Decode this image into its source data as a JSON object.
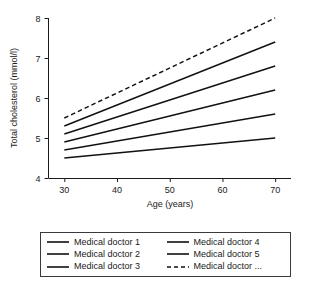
{
  "chart_data": {
    "type": "line",
    "title": "",
    "xlabel": "Age (years)",
    "ylabel": "Total cholesterol (mmol/l)",
    "xlim": [
      27,
      73
    ],
    "ylim": [
      4,
      8
    ],
    "xticks": [
      30,
      40,
      50,
      60,
      70
    ],
    "yticks": [
      4,
      5,
      6,
      7,
      8
    ],
    "xtick_labels": [
      "30",
      "40",
      "50",
      "60",
      "70"
    ],
    "ytick_labels": [
      "4",
      "5",
      "6",
      "7",
      "8"
    ],
    "grid": false,
    "legend_position": "below",
    "legend_columns": 2,
    "x": [
      30,
      70
    ],
    "series": [
      {
        "name": "Medical doctor 1",
        "values": [
          4.5,
          5.0
        ],
        "style": "solid"
      },
      {
        "name": "Medical doctor 2",
        "values": [
          4.7,
          5.6
        ],
        "style": "solid"
      },
      {
        "name": "Medical doctor 3",
        "values": [
          4.9,
          6.2
        ],
        "style": "solid"
      },
      {
        "name": "Medical doctor 4",
        "values": [
          5.1,
          6.8
        ],
        "style": "solid"
      },
      {
        "name": "Medical doctor 5",
        "values": [
          5.3,
          7.4
        ],
        "style": "solid"
      },
      {
        "name": "Medical doctor ...",
        "values": [
          5.5,
          8.0
        ],
        "style": "dashed"
      }
    ],
    "line_color": "#111111"
  },
  "legend": {
    "entries": [
      {
        "label": "Medical doctor 1",
        "style": "solid"
      },
      {
        "label": "Medical doctor 2",
        "style": "solid"
      },
      {
        "label": "Medical doctor 3",
        "style": "solid"
      },
      {
        "label": "Medical doctor 4",
        "style": "solid"
      },
      {
        "label": "Medical doctor 5",
        "style": "solid"
      },
      {
        "label": "Medical doctor ...",
        "style": "dashed"
      }
    ]
  }
}
